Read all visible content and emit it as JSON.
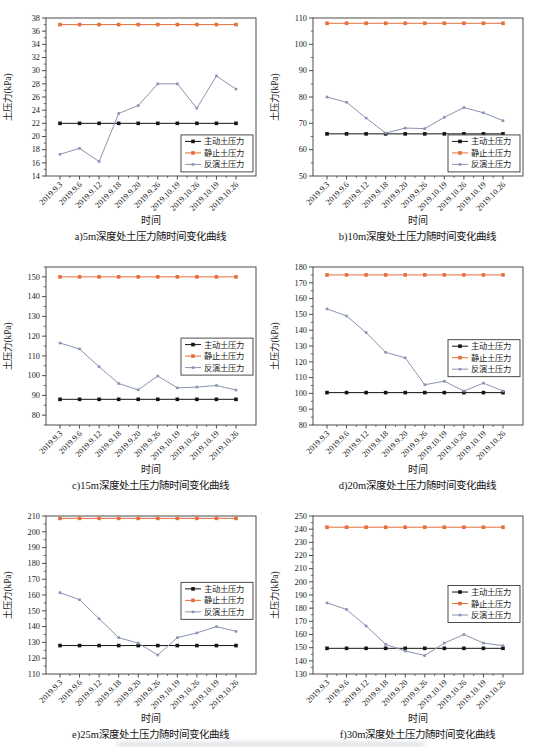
{
  "shared": {
    "x_labels": [
      "2019.9.3",
      "2019.9.6",
      "2019.9.12",
      "2019.9.18",
      "2019.9.20",
      "2019.9.26",
      "2019.10.19",
      "2019.10.26",
      "2019.10.19",
      "2019.10.26"
    ],
    "xlabel": "时间",
    "ylabel": "土压力(kPa)",
    "legend_labels": [
      "主动土压力",
      "静止土压力",
      "反演土压力"
    ],
    "colors": {
      "active": "#141414",
      "static": "#e66e3c",
      "inverted": "#8a94b2"
    }
  },
  "chart_data": [
    {
      "id": "a",
      "type": "line",
      "caption": "a)5m深度处土压力随时间变化曲线",
      "ylim": [
        14,
        38
      ],
      "ytick_major": 2,
      "legend_frac": 0.74,
      "series": [
        {
          "name": "主动土压力",
          "role": "active",
          "value": 22
        },
        {
          "name": "静止土压力",
          "role": "static",
          "value": 37
        },
        {
          "name": "反演土压力",
          "role": "inverted",
          "values": [
            17.3,
            18.2,
            16.2,
            23.5,
            24.7,
            28.0,
            28.0,
            24.3,
            29.2,
            27.2
          ]
        }
      ]
    },
    {
      "id": "b",
      "type": "line",
      "caption": "b)10m深度处土压力随时间变化曲线",
      "ylim": [
        50,
        110
      ],
      "ytick_major": 10,
      "legend_frac": 0.74,
      "series": [
        {
          "name": "主动土压力",
          "role": "active",
          "value": 66
        },
        {
          "name": "静止土压力",
          "role": "static",
          "value": 108
        },
        {
          "name": "反演土压力",
          "role": "inverted",
          "values": [
            80,
            78,
            72,
            66.3,
            68.2,
            68,
            72.3,
            76,
            74,
            71
          ]
        }
      ]
    },
    {
      "id": "c",
      "type": "line",
      "caption": "c)15m深度处土压力随时间变化曲线",
      "ylim": [
        75,
        155
      ],
      "ytick_major": 10,
      "legend_frac": 0.45,
      "series": [
        {
          "name": "主动土压力",
          "role": "active",
          "value": 88
        },
        {
          "name": "静止土压力",
          "role": "static",
          "value": 150
        },
        {
          "name": "反演土压力",
          "role": "inverted",
          "values": [
            116.5,
            113.5,
            104.5,
            96,
            92.8,
            99.8,
            93.8,
            94.2,
            95,
            92.7
          ]
        }
      ]
    },
    {
      "id": "d",
      "type": "line",
      "caption": "d)20m深度处土压力随时间变化曲线",
      "ylim": [
        80,
        180
      ],
      "ytick_major": 10,
      "legend_frac": 0.46,
      "series": [
        {
          "name": "主动土压力",
          "role": "active",
          "value": 100.5
        },
        {
          "name": "静止土压力",
          "role": "static",
          "value": 175
        },
        {
          "name": "反演土压力",
          "role": "inverted",
          "values": [
            153.5,
            149,
            138.5,
            126,
            122.5,
            105.5,
            107.7,
            101.5,
            106.5,
            101.5
          ]
        }
      ]
    },
    {
      "id": "e",
      "type": "line",
      "caption": "e)25m深度处土压力随时间变化曲线",
      "ylim": [
        110,
        210
      ],
      "ytick_major": 10,
      "legend_frac": 0.42,
      "series": [
        {
          "name": "主动土压力",
          "role": "active",
          "value": 128
        },
        {
          "name": "静止土压力",
          "role": "static",
          "value": 208.5
        },
        {
          "name": "反演土压力",
          "role": "inverted",
          "values": [
            161.5,
            157,
            145,
            133,
            129.5,
            122,
            133,
            136,
            140,
            137
          ]
        }
      ]
    },
    {
      "id": "f",
      "type": "line",
      "caption": "f)30m深度处土压力随时间变化曲线",
      "ylim": [
        130,
        250
      ],
      "ytick_major": 10,
      "legend_frac": 0.44,
      "series": [
        {
          "name": "主动土压力",
          "role": "active",
          "value": 149.5
        },
        {
          "name": "静止土压力",
          "role": "static",
          "value": 241.5
        },
        {
          "name": "反演土压力",
          "role": "inverted",
          "values": [
            184,
            179,
            166.5,
            152.5,
            147.5,
            144,
            153.5,
            160,
            153.5,
            151.5
          ]
        }
      ]
    }
  ]
}
